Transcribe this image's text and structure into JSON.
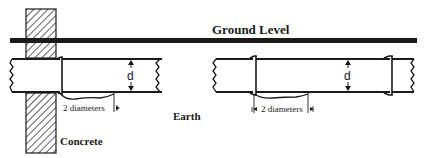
{
  "diagram": {
    "labels": {
      "ground_level": "Ground Level",
      "earth": "Earth",
      "concrete": "Concrete",
      "diameter_symbol_left": "d",
      "diameter_symbol_right": "d",
      "settlement_length_left": "2 diameters",
      "settlement_length_right": "2 diameters"
    },
    "components": {
      "ground_line": "ground-level line",
      "wall": "concrete wall (hatched)",
      "left_pipe": "pipe passing through concrete wall with joint",
      "right_pipe": "pipe section with two joints"
    },
    "colors": {
      "ink": "#1a1a1a",
      "background": "#ffffff"
    }
  }
}
